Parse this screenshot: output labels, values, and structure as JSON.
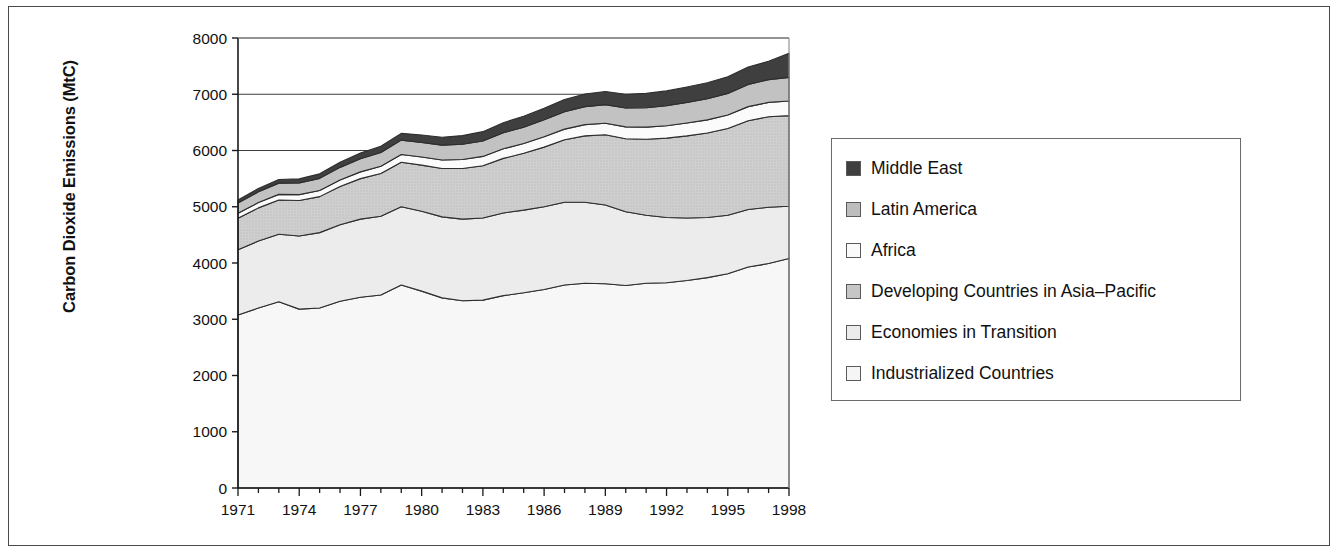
{
  "chart_data": {
    "type": "area",
    "title": "",
    "xlabel": "",
    "ylabel": "Carbon Dioxide Emissions (MtC)",
    "xlim": [
      1971,
      1998
    ],
    "ylim": [
      0,
      8000
    ],
    "yticks": [
      0,
      1000,
      2000,
      3000,
      4000,
      5000,
      6000,
      7000,
      8000
    ],
    "xticks": [
      1971,
      1974,
      1977,
      1980,
      1983,
      1986,
      1989,
      1992,
      1995,
      1998
    ],
    "xtick_labels": [
      "1971",
      "1974",
      "1977",
      "1980",
      "1983",
      "1986",
      "1989",
      "1992",
      "1995",
      "1998"
    ],
    "ytick_labels": [
      "0",
      "1000",
      "2000",
      "3000",
      "4000",
      "5000",
      "6000",
      "7000",
      "8000"
    ],
    "grid": "horizontal",
    "stacked": true,
    "legend_position": "right",
    "x": [
      1971,
      1972,
      1973,
      1974,
      1975,
      1976,
      1977,
      1978,
      1979,
      1980,
      1981,
      1982,
      1983,
      1984,
      1985,
      1986,
      1987,
      1988,
      1989,
      1990,
      1991,
      1992,
      1993,
      1994,
      1995,
      1996,
      1997,
      1998
    ],
    "series": [
      {
        "name": "Industrialized Countries",
        "color": "#f5f5f5",
        "values": [
          3075,
          3200,
          3310,
          3180,
          3200,
          3320,
          3390,
          3430,
          3610,
          3500,
          3380,
          3330,
          3340,
          3420,
          3470,
          3530,
          3610,
          3640,
          3630,
          3600,
          3640,
          3650,
          3690,
          3740,
          3810,
          3930,
          3990,
          4080
        ]
      },
      {
        "name": "Economies in Transition",
        "color": "#ececec",
        "values": [
          1160,
          1190,
          1200,
          1300,
          1340,
          1360,
          1390,
          1400,
          1390,
          1420,
          1440,
          1450,
          1460,
          1470,
          1470,
          1470,
          1470,
          1440,
          1400,
          1310,
          1210,
          1160,
          1110,
          1070,
          1040,
          1020,
          1000,
          930
        ]
      },
      {
        "name": "Developing Countries in Asia-Pacific",
        "color": "#c6c6c6",
        "values": [
          560,
          590,
          610,
          630,
          640,
          680,
          720,
          760,
          790,
          820,
          860,
          900,
          930,
          970,
          1010,
          1060,
          1110,
          1180,
          1250,
          1300,
          1350,
          1410,
          1460,
          1500,
          1540,
          1580,
          1610,
          1610
        ]
      },
      {
        "name": "Africa",
        "color": "#fafafa",
        "values": [
          90,
          95,
          100,
          105,
          110,
          115,
          120,
          130,
          140,
          145,
          150,
          160,
          165,
          170,
          175,
          185,
          190,
          200,
          205,
          210,
          215,
          220,
          230,
          235,
          240,
          250,
          255,
          260
        ]
      },
      {
        "name": "Latin America",
        "color": "#bdbdbd",
        "values": [
          180,
          190,
          200,
          210,
          215,
          225,
          235,
          245,
          255,
          260,
          265,
          270,
          275,
          285,
          290,
          300,
          310,
          320,
          330,
          335,
          345,
          355,
          365,
          375,
          385,
          395,
          405,
          420
        ]
      },
      {
        "name": "Middle East",
        "color": "#3f3f3f",
        "values": [
          55,
          60,
          65,
          70,
          80,
          90,
          100,
          110,
          120,
          130,
          140,
          155,
          165,
          180,
          195,
          205,
          215,
          225,
          235,
          245,
          255,
          265,
          275,
          285,
          295,
          310,
          325,
          430
        ]
      }
    ],
    "totals_note": ""
  },
  "legend": {
    "items": [
      {
        "label": "Middle East",
        "color": "#3f3f3f"
      },
      {
        "label": "Latin America",
        "color": "#bdbdbd"
      },
      {
        "label": "Africa",
        "color": "#fafafa"
      },
      {
        "label": "Developing Countries in Asia–Pacific",
        "color": "#c6c6c6"
      },
      {
        "label": "Economies in Transition",
        "color": "#ececec"
      },
      {
        "label": "Industrialized Countries",
        "color": "#f5f5f5"
      }
    ]
  },
  "axis": {
    "y_title": "Carbon Dioxide Emissions (MtC)"
  }
}
